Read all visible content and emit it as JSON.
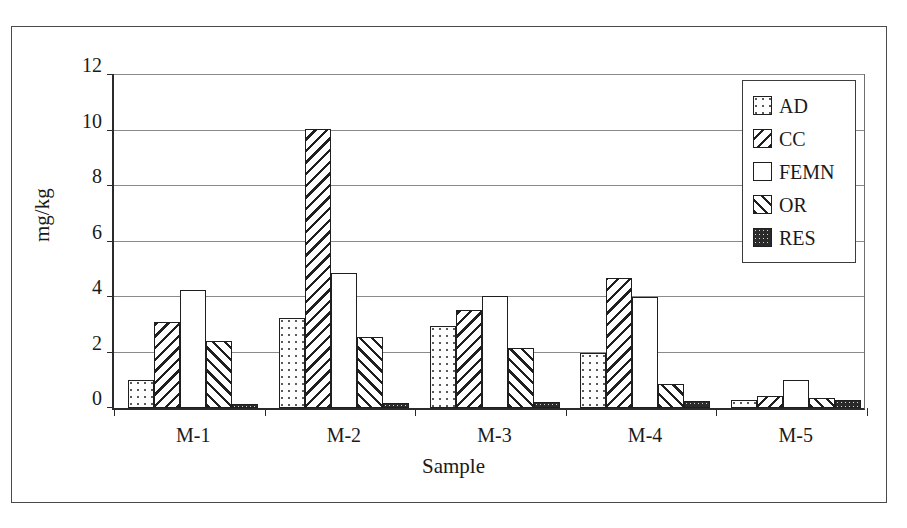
{
  "chart_data": {
    "type": "bar",
    "title": "",
    "xlabel": "Sample",
    "ylabel": "mg/kg",
    "categories": [
      "M-1",
      "M-2",
      "M-3",
      "M-4",
      "M-5"
    ],
    "ylim": [
      0,
      12
    ],
    "yticks": [
      0,
      2,
      4,
      6,
      8,
      10,
      12
    ],
    "ytick_labels": [
      "0",
      "2",
      "4",
      "6",
      "8",
      "10",
      "12"
    ],
    "grid": true,
    "grid_axis": "y",
    "legend_position": "top-right",
    "series": [
      {
        "name": "AD",
        "pattern": "dotted-light",
        "values": [
          1.0,
          3.25,
          2.95,
          2.0,
          0.3
        ]
      },
      {
        "name": "CC",
        "pattern": "backslash-hatch",
        "values": [
          3.1,
          10.05,
          3.55,
          4.7,
          0.45
        ]
      },
      {
        "name": "FEMN",
        "pattern": "solid-white",
        "values": [
          4.25,
          4.85,
          4.05,
          4.0,
          1.0
        ]
      },
      {
        "name": "OR",
        "pattern": "forwardslash-hatch",
        "values": [
          2.4,
          2.55,
          2.15,
          0.85,
          0.35
        ]
      },
      {
        "name": "RES",
        "pattern": "dark-dense",
        "values": [
          0.15,
          0.18,
          0.22,
          0.27,
          0.28
        ]
      }
    ]
  },
  "legend": {
    "items": [
      {
        "label": "AD"
      },
      {
        "label": "CC"
      },
      {
        "label": "FEMN"
      },
      {
        "label": "OR"
      },
      {
        "label": "RES"
      }
    ]
  },
  "colors": {
    "axis": "#2b2b2b",
    "grid": "#8a8a8a",
    "bar_outline": "#1f1f1f",
    "background": "#ffffff",
    "text": "#1a1a1a"
  }
}
